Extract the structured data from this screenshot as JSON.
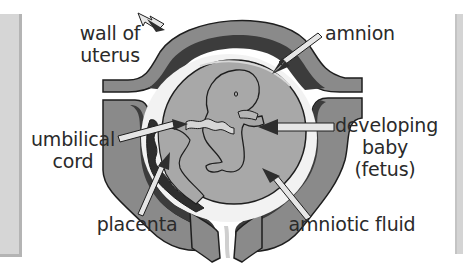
{
  "diagram": {
    "type": "labeled anatomical diagram",
    "labels": [
      {
        "id": "wall_of_uterus",
        "lines": [
          "wall of",
          "uterus"
        ]
      },
      {
        "id": "amnion",
        "lines": [
          "amnion"
        ]
      },
      {
        "id": "umbilical_cord",
        "lines": [
          "umbilical",
          "cord"
        ]
      },
      {
        "id": "developing_baby",
        "lines": [
          "developing",
          "baby",
          "(fetus)"
        ]
      },
      {
        "id": "placenta",
        "lines": [
          "placenta"
        ]
      },
      {
        "id": "amniotic_fluid",
        "lines": [
          "amniotic fluid"
        ]
      }
    ],
    "colors": {
      "uterus_outer": "#8a8a8a",
      "uterus_inner": "#3c3c3c",
      "amniotic_sac": "#a8a8a8",
      "fluid_gap": "#f2f2f2",
      "placenta": "#2e2e2e",
      "arrow_fill": "#e6e6e6",
      "outline": "#1e1e1e",
      "text": "#2a2a2a",
      "side_bar": "#d6d6d6"
    }
  }
}
